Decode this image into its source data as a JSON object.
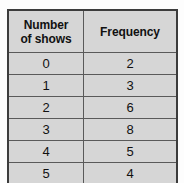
{
  "table": {
    "headers": {
      "category": "Number of shows",
      "category_line1": "Number",
      "category_line2": "of shows",
      "value": "Frequency"
    },
    "rows": [
      {
        "category": "0",
        "value": "2"
      },
      {
        "category": "1",
        "value": "3"
      },
      {
        "category": "2",
        "value": "6"
      },
      {
        "category": "3",
        "value": "8"
      },
      {
        "category": "4",
        "value": "5"
      },
      {
        "category": "5",
        "value": "4"
      }
    ]
  },
  "colors": {
    "cell_background": "#d6d6d6",
    "outer_border": "#3c3c3c",
    "inner_border": "#5a5a5a",
    "text": "#111111",
    "page_background": "#ffffff"
  }
}
